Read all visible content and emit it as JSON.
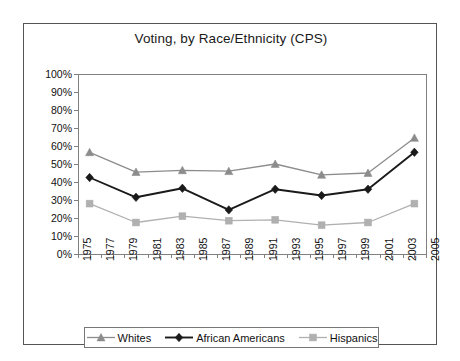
{
  "chart_data": {
    "type": "line",
    "title": "Voting, by Race/Ethnicity (CPS)",
    "xlabel": "",
    "ylabel": "",
    "xlim": [
      1975,
      2005
    ],
    "ylim": [
      0,
      100
    ],
    "grid": false,
    "legend_position": "bottom",
    "y_tick_labels": [
      "100%",
      "90%",
      "80%",
      "70%",
      "60%",
      "50%",
      "40%",
      "30%",
      "20%",
      "10%",
      "0%"
    ],
    "y_tick_values": [
      100,
      90,
      80,
      70,
      60,
      50,
      40,
      30,
      20,
      10,
      0
    ],
    "x_tick_labels": [
      "1975",
      "1977",
      "1979",
      "1981",
      "1983",
      "1985",
      "1987",
      "1989",
      "1991",
      "1993",
      "1995",
      "1997",
      "1999",
      "2001",
      "2003",
      "2005"
    ],
    "x_tick_values": [
      1975,
      1977,
      1979,
      1981,
      1983,
      1985,
      1987,
      1989,
      1991,
      1993,
      1995,
      1997,
      1999,
      2001,
      2003,
      2005
    ],
    "x_minor_step": 1,
    "x": [
      1976,
      1980,
      1984,
      1988,
      1992,
      1996,
      2000,
      2004
    ],
    "series": [
      {
        "name": "Whites",
        "color": "#8c8c8c",
        "marker": "triangle",
        "values": [
          56.5,
          45.5,
          46.5,
          46.0,
          50.0,
          44.0,
          45.0,
          64.5
        ]
      },
      {
        "name": "African Americans",
        "color": "#1a1a1a",
        "marker": "diamond",
        "values": [
          42.5,
          31.5,
          36.5,
          24.5,
          36.0,
          32.5,
          36.0,
          56.5
        ]
      },
      {
        "name": "Hispanics",
        "color": "#b0b0b0",
        "marker": "square",
        "values": [
          28.0,
          17.5,
          21.0,
          18.5,
          19.0,
          16.0,
          17.5,
          28.0
        ]
      }
    ]
  },
  "legend": {
    "items": [
      {
        "label": "Whites"
      },
      {
        "label": "African Americans"
      },
      {
        "label": "Hispanics"
      }
    ]
  },
  "colors": {
    "frame": "#555555",
    "plot_border": "#808080",
    "axis": "#808080",
    "text": "#111111"
  }
}
